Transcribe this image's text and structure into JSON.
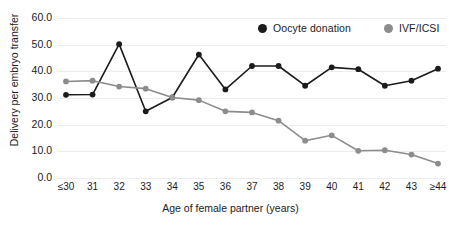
{
  "chart_data": {
    "type": "line",
    "title": "",
    "xlabel": "Age of female partner (years)",
    "ylabel": "Delivery per embryo transfer",
    "categories": [
      "≤30",
      "31",
      "32",
      "33",
      "34",
      "35",
      "36",
      "37",
      "38",
      "39",
      "40",
      "41",
      "42",
      "43",
      "≥44"
    ],
    "series": [
      {
        "name": "Oocyte donation",
        "color": "#1b1b1b",
        "values": [
          31.2,
          31.3,
          50.2,
          25.0,
          30.2,
          46.3,
          33.2,
          42.0,
          42.0,
          34.6,
          41.5,
          40.8,
          34.6,
          36.5,
          41.0
        ]
      },
      {
        "name": "IVF/ICSI",
        "color": "#8c8c8c",
        "values": [
          36.2,
          36.5,
          34.3,
          33.5,
          30.2,
          29.2,
          25.0,
          24.6,
          21.5,
          14.0,
          16.0,
          10.2,
          10.4,
          8.8,
          5.4
        ]
      }
    ],
    "ylim": [
      0,
      60
    ],
    "yticks": [
      0.0,
      10.0,
      20.0,
      30.0,
      40.0,
      50.0,
      60.0
    ],
    "ytick_labels": [
      "0.0",
      "10.0",
      "20.0",
      "30.0",
      "40.0",
      "50.0",
      "60.0"
    ],
    "grid": true,
    "legend_position": "top-right"
  },
  "legend": {
    "items": [
      {
        "label": "Oocyte donation",
        "color": "#1b1b1b",
        "marker": "legend-dot-icon"
      },
      {
        "label": "IVF/ICSI",
        "color": "#8c8c8c",
        "marker": "legend-dot-icon"
      }
    ]
  }
}
